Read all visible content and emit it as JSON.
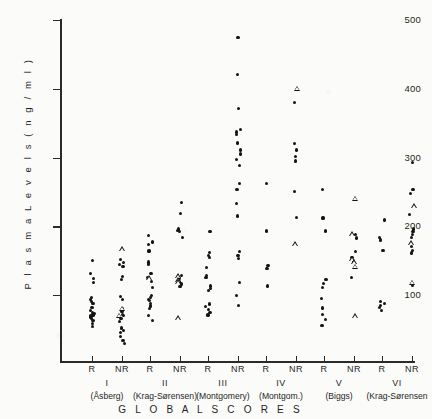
{
  "chart_data": {
    "type": "scatter",
    "title": "",
    "xlabel": "GLOBAL SCORES",
    "ylabel": "P l a s m a   L e v e l s   ( n g / m l )",
    "ylim": [
      0,
      500
    ],
    "yticks": [
      100,
      200,
      300,
      400,
      500
    ],
    "ytick_labels": [
      "100",
      "200",
      "300",
      "400",
      "500"
    ],
    "grid": false,
    "legend": "none",
    "marker_types": [
      {
        "key": "dot",
        "name": "filled-circle",
        "color": "#141414"
      },
      {
        "key": "triangle",
        "name": "open-triangle",
        "color": "#141414"
      }
    ],
    "categories": [
      "I R",
      "I NR",
      "II R",
      "II NR",
      "III R",
      "III NR",
      "IV R",
      "IV NR",
      "V R",
      "V NR",
      "VI R",
      "VI NR"
    ],
    "groups": [
      {
        "roman": "I",
        "name": "(Åsberg)",
        "columns": [
          {
            "label": "R",
            "dots": [
              150,
              131,
              124,
              118,
              96,
              94,
              91,
              88,
              82,
              78,
              75,
              73,
              71,
              70,
              69,
              68,
              66,
              63,
              58,
              54
            ],
            "triangles": []
          },
          {
            "label": "NR",
            "dots": [
              152,
              147,
              144,
              141,
              127,
              122,
              98,
              94,
              80,
              76,
              72,
              70,
              66,
              62,
              52,
              48,
              45,
              40,
              34,
              30
            ],
            "triangles": [
              165,
              78,
              68
            ]
          }
        ]
      },
      {
        "roman": "II",
        "name": "(Krag-Sørensen)",
        "columns": [
          {
            "label": "R",
            "dots": [
              186,
              177,
              173,
              164,
              148,
              145,
              131,
              126,
              120,
              111,
              99,
              96,
              94,
              92,
              88,
              84,
              80,
              70,
              63
            ],
            "triangles": [
              122
            ]
          },
          {
            "label": "NR",
            "dots": [
              234,
              219,
              196,
              194,
              192,
              184,
              128,
              124,
              119,
              116,
              112
            ],
            "triangles": [
              125,
              120,
              117,
              64
            ]
          }
        ]
      },
      {
        "roman": "III",
        "name": "(Montgomery)",
        "columns": [
          {
            "label": "R",
            "dots": [
              192,
              162,
              158,
              155,
              140,
              128,
              125,
              113,
              110,
              107,
              87,
              83,
              79,
              75,
              71
            ],
            "triangles": []
          },
          {
            "label": "NR",
            "dots": [
              475,
              421,
              371,
              341,
              337,
              334,
              321,
              311,
              305,
              297,
              288,
              262,
              254,
              233,
              215,
              163,
              158,
              153,
              118,
              99,
              85
            ],
            "triangles": []
          }
        ]
      },
      {
        "roman": "IV",
        "name": "(Montgom.)",
        "columns": [
          {
            "label": "R",
            "dots": [
              262,
              193,
              143,
              139,
              113
            ],
            "triangles": []
          },
          {
            "label": "NR",
            "dots": [
              380,
              320,
              311,
              302,
              295,
              250,
              213
            ],
            "triangles": [
              398,
              172
            ]
          }
        ]
      },
      {
        "roman": "V",
        "name": "(Biggs)",
        "columns": [
          {
            "label": "R",
            "dots": [
              254,
              212,
              193,
              123,
              117,
              111,
              95,
              81,
              72,
              64,
              56
            ],
            "triangles": []
          },
          {
            "label": "NR",
            "dots": [
              188,
              183,
              163,
              155,
              148,
              125
            ],
            "triangles": [
              238,
              186,
              150,
              146,
              139,
              67
            ]
          }
        ]
      },
      {
        "roman": "VI",
        "name": "(Krag-Sørensen",
        "columns": [
          {
            "label": "R",
            "dots": [
              209,
              184,
              180,
              165,
              91,
              88,
              85,
              82,
              78
            ],
            "triangles": []
          },
          {
            "label": "NR",
            "dots": [
              293,
              253,
              248,
              217,
              196,
              192,
              188,
              184,
              170,
              165,
              161,
              114
            ],
            "triangles": [
              227,
              173,
              116
            ]
          }
        ]
      }
    ]
  },
  "axis": {
    "y_title": "P l a s m a   L e v e l s   ( n g / m l )",
    "x_title": "G L O B A L   S C O R E S"
  }
}
